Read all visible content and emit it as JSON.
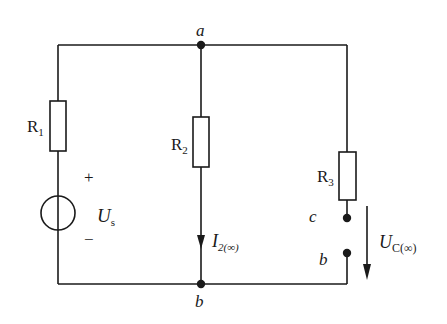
{
  "diagram": {
    "type": "circuit",
    "colors": {
      "stroke": "#1a1a1a",
      "background": "#ffffff"
    },
    "nodes": {
      "a": "a",
      "b_bottom": "b",
      "c": "c",
      "b_right": "b"
    },
    "components": {
      "R1": {
        "letter": "R",
        "sub": "1"
      },
      "R2": {
        "letter": "R",
        "sub": "2"
      },
      "R3": {
        "letter": "R",
        "sub": "3"
      },
      "source": {
        "letter": "U",
        "sub": "s",
        "plus": "+",
        "minus": "−"
      }
    },
    "current": {
      "letter": "I",
      "sub": "2(∞)"
    },
    "voltage": {
      "letter": "U",
      "sub": "C(∞)"
    }
  }
}
